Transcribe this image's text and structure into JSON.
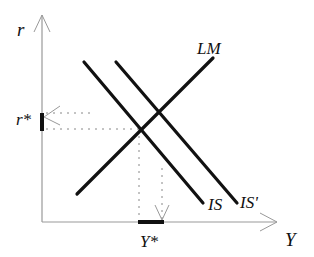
{
  "diagram": {
    "type": "IS-LM",
    "axes": {
      "y_label": "r",
      "x_label": "Y"
    },
    "curves": [
      {
        "name": "LM",
        "label": "LM"
      },
      {
        "name": "IS",
        "label": "IS"
      },
      {
        "name": "IS'",
        "label": "IS'"
      }
    ],
    "equilibrium": {
      "r_label": "r*",
      "y_label": "Y*"
    },
    "colors": {
      "axis": "#999999",
      "curve": "#111111",
      "dotted": "#888888"
    }
  }
}
